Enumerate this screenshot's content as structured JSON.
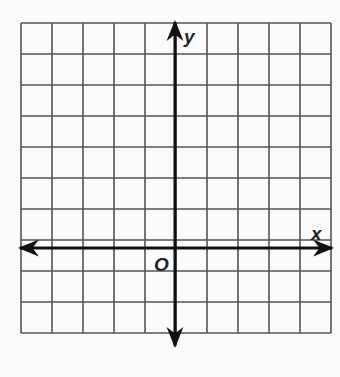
{
  "diagram": {
    "type": "coordinate-grid",
    "columns": 10,
    "rows": 10,
    "x_axis_label": "x",
    "y_axis_label": "y",
    "origin_label": "O",
    "colors": {
      "grid": "#555555",
      "axis": "#111111",
      "background": "#fbfbfb"
    }
  }
}
